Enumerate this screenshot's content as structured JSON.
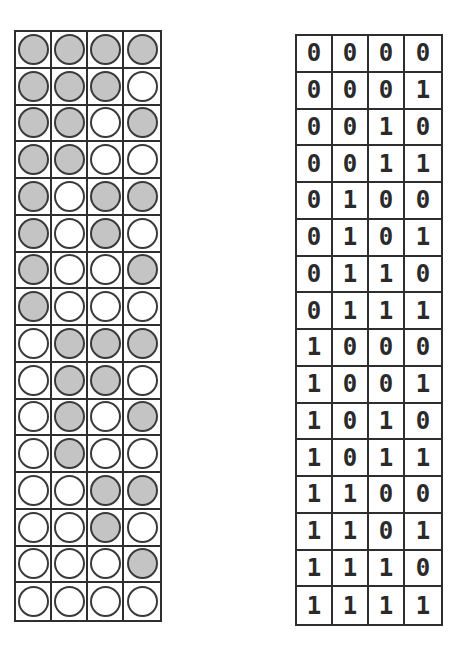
{
  "diagram": {
    "colors": {
      "filled_circle": "#c4c4c4",
      "empty_circle": "#ffffff",
      "grid_line": "#2e2e2e",
      "digit": "#2a2a2a"
    },
    "legend": {
      "filled": "0",
      "empty": "1"
    },
    "rows": [
      [
        "0",
        "0",
        "0",
        "0"
      ],
      [
        "0",
        "0",
        "0",
        "1"
      ],
      [
        "0",
        "0",
        "1",
        "0"
      ],
      [
        "0",
        "0",
        "1",
        "1"
      ],
      [
        "0",
        "1",
        "0",
        "0"
      ],
      [
        "0",
        "1",
        "0",
        "1"
      ],
      [
        "0",
        "1",
        "1",
        "0"
      ],
      [
        "0",
        "1",
        "1",
        "1"
      ],
      [
        "1",
        "0",
        "0",
        "0"
      ],
      [
        "1",
        "0",
        "0",
        "1"
      ],
      [
        "1",
        "0",
        "1",
        "0"
      ],
      [
        "1",
        "0",
        "1",
        "1"
      ],
      [
        "1",
        "1",
        "0",
        "0"
      ],
      [
        "1",
        "1",
        "0",
        "1"
      ],
      [
        "1",
        "1",
        "1",
        "0"
      ],
      [
        "1",
        "1",
        "1",
        "1"
      ]
    ]
  }
}
